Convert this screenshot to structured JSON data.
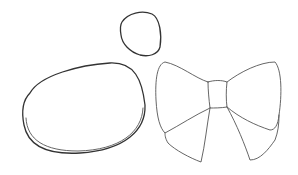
{
  "image": {
    "description": "Pencil line sketch of three shapes on white paper",
    "width": 298,
    "height": 175,
    "colors": {
      "background": "#ffffff",
      "line": "#333333"
    },
    "shapes": [
      {
        "name": "large-oval",
        "kind": "rounded oval"
      },
      {
        "name": "small-rounded-shape",
        "kind": "rounded triangle / egg"
      },
      {
        "name": "bow",
        "kind": "bow with knot and two ribbon tails"
      }
    ]
  }
}
